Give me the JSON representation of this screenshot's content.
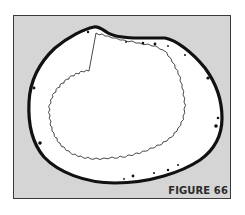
{
  "figure": {
    "caption": "FIGURE 66",
    "colors": {
      "background": "#d5d5d5",
      "frame_border": "#3a3a3a",
      "outline": "#111111",
      "interior": "#ffffff",
      "caption": "#2b2b2b"
    }
  }
}
